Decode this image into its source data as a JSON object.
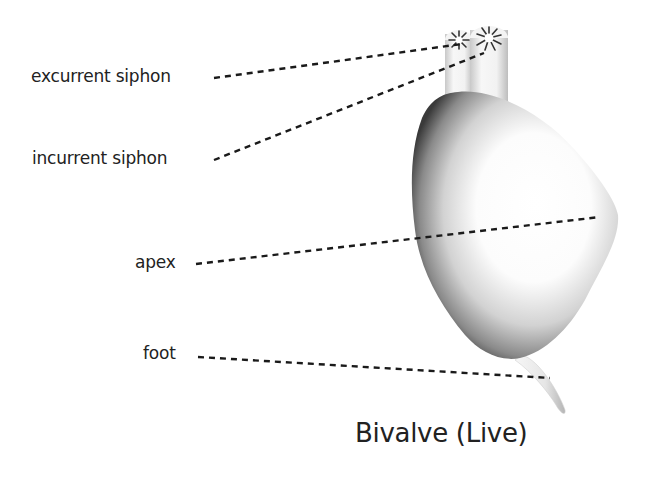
{
  "diagram": {
    "title": "Bivalve (Live)",
    "labels": {
      "excurrent_siphon": "excurrent siphon",
      "incurrent_siphon": "incurrent siphon",
      "apex": "apex",
      "foot": "foot"
    },
    "colors": {
      "text": "#222222",
      "leader_line": "#1a1a1a",
      "shell_dark": "#3a3a3a",
      "shell_light": "#ffffff"
    }
  }
}
